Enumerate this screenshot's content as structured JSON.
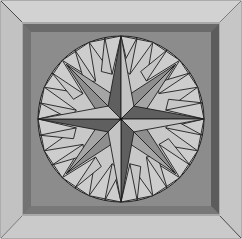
{
  "figure": {
    "width": 242,
    "height": 239
  },
  "colors": {
    "frame_light": "#c9c9c9",
    "frame_top": "#d4d4d4",
    "frame_side": "#bdbdbd",
    "frame_outline": "#5a5a5a",
    "inner_band_dark": "#6e6e6e",
    "inner_band_mid": "#8a8a8a",
    "field": "#8c8c8c",
    "circle_fill": "#c8c8c8",
    "star_dark": "#5f5f5f",
    "star_light": "#c4c4c4",
    "star_mid": "#8e8e8e",
    "line": "#1e1e1e"
  },
  "geometry": {
    "center": [
      121,
      119
    ],
    "radius": 83,
    "star_points": 8,
    "fill_triangles_per_gap": 2
  }
}
